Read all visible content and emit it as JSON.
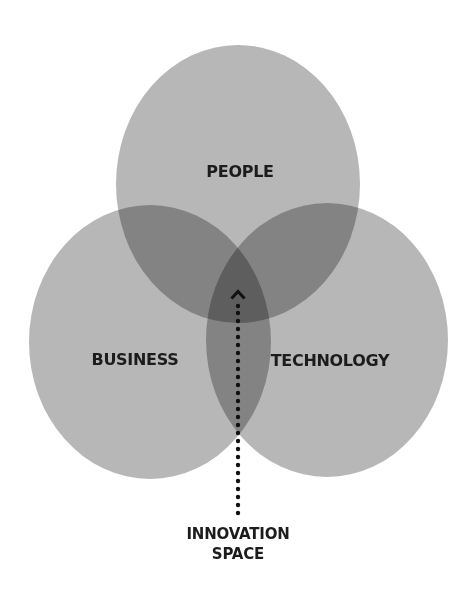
{
  "diagram": {
    "type": "venn",
    "colors": {
      "circle_fill": "#b7b7b7",
      "overlap_fill": "#9b9b9b",
      "center_fill": "#808080",
      "text": "#1c1c1c",
      "background": "#ffffff"
    },
    "sets": [
      {
        "id": "people",
        "label": "PEOPLE"
      },
      {
        "id": "business",
        "label": "BUSINESS"
      },
      {
        "id": "technology",
        "label": "TECHNOLOGY"
      }
    ],
    "intersection": {
      "label_line1": "INNOVATION",
      "label_line2": "SPACE",
      "pointer": "dotted-arrow-up"
    }
  }
}
